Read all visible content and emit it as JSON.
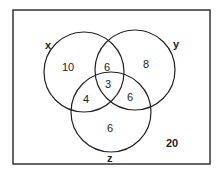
{
  "diagram": {
    "type": "venn-3",
    "universe_total": "20",
    "sets": [
      {
        "name": "x",
        "label": "x"
      },
      {
        "name": "y",
        "label": "y"
      },
      {
        "name": "z",
        "label": "z"
      }
    ],
    "regions": {
      "x_only": "10",
      "y_only": "8",
      "z_only": "6",
      "x_and_y_only": "6",
      "x_and_z_only": "4",
      "y_and_z_only": "6",
      "x_y_z": "3",
      "outside": "20"
    },
    "colors": {
      "stroke": "#222222",
      "background": "#ffffff"
    }
  }
}
